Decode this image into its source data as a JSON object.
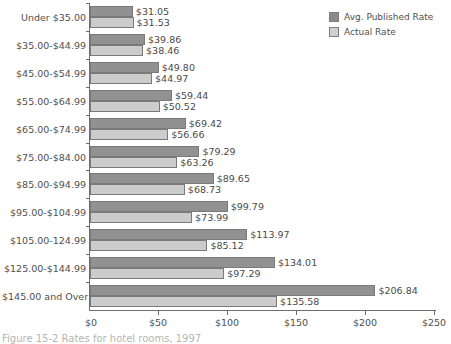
{
  "chart_data": {
    "type": "bar",
    "orientation": "horizontal",
    "title": "",
    "xlabel": "",
    "ylabel": "",
    "xlim": [
      0,
      250
    ],
    "xticks": [
      0,
      50,
      100,
      150,
      200,
      250
    ],
    "xtick_labels": [
      "$0",
      "$50",
      "$100",
      "$150",
      "$200",
      "$250"
    ],
    "grid": false,
    "legend_position": "top-right",
    "categories": [
      "Under $35.00",
      "$35.00-$44.99",
      "$45.00-$54.99",
      "$55.00-$64.99",
      "$65.00-$74.99",
      "$75.00-$84.00",
      "$85.00-$94.99",
      "$95.00-$104.99",
      "$105.00-124.99",
      "$125.00-$144.99",
      "$145.00 and Over"
    ],
    "series": [
      {
        "name": "Avg. Published Rate",
        "color": "#919191",
        "values": [
          31.05,
          39.86,
          49.8,
          59.44,
          69.42,
          79.29,
          89.65,
          99.79,
          113.97,
          134.01,
          206.84
        ],
        "labels": [
          "$31.05",
          "$39.86",
          "$49.80",
          "$59.44",
          "$69.42",
          "$79.29",
          "$89.65",
          "$99.79",
          "$113.97",
          "$134.01",
          "$206.84"
        ]
      },
      {
        "name": "Actual Rate",
        "color": "#cccccc",
        "values": [
          31.53,
          38.46,
          44.97,
          50.52,
          56.66,
          63.26,
          68.73,
          73.99,
          85.12,
          97.29,
          135.58
        ],
        "labels": [
          "$31.53",
          "$38.46",
          "$44.97",
          "$50.52",
          "$56.66",
          "$63.26",
          "$68.73",
          "$73.99",
          "$85.12",
          "$97.29",
          "$135.58"
        ]
      }
    ]
  },
  "legend": {
    "items": [
      {
        "label": "Avg. Published Rate",
        "swatch": "published"
      },
      {
        "label": "Actual Rate",
        "swatch": "actual"
      }
    ]
  },
  "caption": {
    "text": "Figure 15-2  Rates for hotel rooms, 1997"
  }
}
